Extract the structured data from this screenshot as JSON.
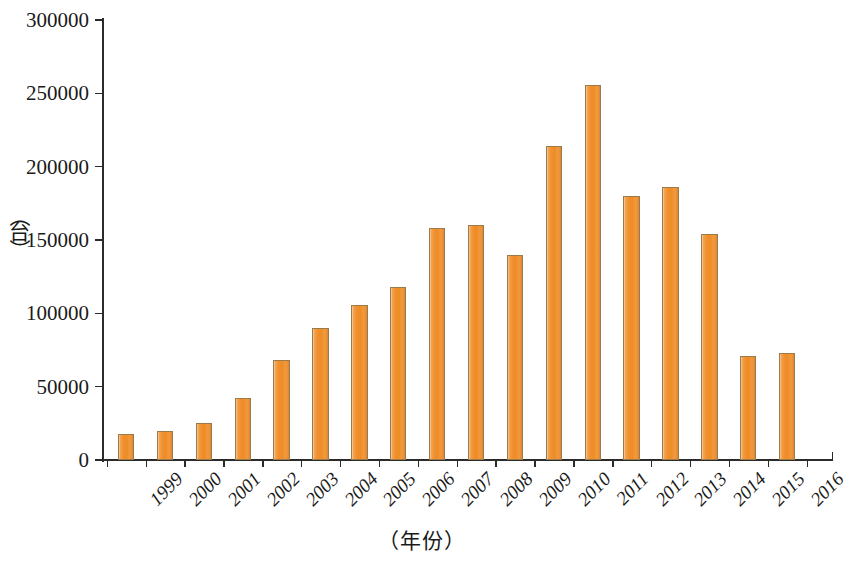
{
  "chart_data": {
    "type": "bar",
    "title": "",
    "xlabel": "（年份）",
    "ylabel": "（台）",
    "categories": [
      "1999",
      "2000",
      "2001",
      "2002",
      "2003",
      "2004",
      "2005",
      "2006",
      "2007",
      "2008",
      "2009",
      "2010",
      "2011",
      "2012",
      "2013",
      "2014",
      "2015",
      "2016"
    ],
    "values": [
      17800,
      19800,
      25000,
      42000,
      68000,
      90000,
      106000,
      118000,
      158000,
      160000,
      140000,
      214000,
      256000,
      180000,
      186000,
      154000,
      71000,
      73000
    ],
    "ylim": [
      0,
      300000
    ],
    "yticks": [
      0,
      50000,
      100000,
      150000,
      200000,
      250000,
      300000
    ],
    "ytick_labels": [
      "0",
      "50000",
      "100000",
      "150000",
      "200000",
      "250000",
      "300000"
    ],
    "grid": false,
    "legend": "none",
    "series": [
      {
        "name": "",
        "values": [
          17800,
          19800,
          25000,
          42000,
          68000,
          90000,
          106000,
          118000,
          158000,
          160000,
          140000,
          214000,
          256000,
          180000,
          186000,
          154000,
          71000,
          73000
        ]
      }
    ],
    "bar_color": "#ef8f2c",
    "bar_border_color": "#9b7b4a",
    "axis_color": "#2b2b2b"
  },
  "axis_titles": {
    "x": "（年份）",
    "y_open_paren": "（",
    "y_char": "台",
    "y_close_paren": "）"
  }
}
